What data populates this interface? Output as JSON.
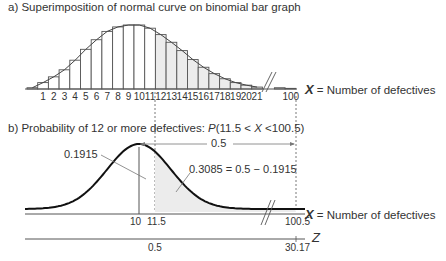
{
  "panel_a": {
    "title": "a) Superimposition of normal curve on binomial bar graph",
    "axis_label_var": "X",
    "axis_label_text": " = Number of defectives",
    "tick_labels": [
      "1",
      "2",
      "3",
      "4",
      "5",
      "6",
      "7",
      "8",
      "9",
      "10",
      "11",
      "12",
      "13",
      "14",
      "15",
      "16",
      "17",
      "18",
      "19",
      "20",
      "21",
      "100"
    ]
  },
  "panel_b": {
    "title_prefix": "b) Probability of 12 or more defectives: ",
    "title_p": "P",
    "title_expr_1": "(11.5 < ",
    "title_x": "X",
    "title_expr_2": " <100.5)",
    "label_0_5_top": "0.5",
    "label_left_area": "0.1915",
    "label_right_area": "0.3085 = 0.5 − 0.1915",
    "x_axis_label_var": "X",
    "x_axis_label_text": " = Number of defectives",
    "x_ticks": [
      "10",
      "11.5",
      "100.5"
    ],
    "z_axis_label": "Z",
    "z_ticks": [
      "0.5",
      "30.17"
    ]
  },
  "chart_data": [
    {
      "type": "bar",
      "title": "a) Superimposition of normal curve on binomial bar graph",
      "xlabel": "X = Number of defectives",
      "ylabel": "",
      "categories": [
        "0",
        "1",
        "2",
        "3",
        "4",
        "5",
        "6",
        "7",
        "8",
        "9",
        "10",
        "11",
        "12",
        "13",
        "14",
        "15",
        "16",
        "17",
        "18",
        "19",
        "20",
        "21",
        "...",
        "100"
      ],
      "values": [
        0.02,
        0.1,
        0.19,
        0.3,
        0.45,
        0.62,
        0.77,
        0.9,
        0.97,
        1.0,
        1.0,
        0.95,
        0.85,
        0.73,
        0.6,
        0.46,
        0.34,
        0.24,
        0.16,
        0.1,
        0.06,
        0.03,
        0.02,
        0.01
      ],
      "shaded_from": "12",
      "overlay": "normal curve",
      "grid": false
    },
    {
      "type": "area",
      "title": "b) Probability of 12 or more defectives: P(11.5 < X <100.5)",
      "xlabel": "X = Number of defectives",
      "secondary_xlabel": "Z",
      "x_ticks": [
        10,
        11.5,
        100.5
      ],
      "z_ticks": [
        0.5,
        30.17
      ],
      "mean": 10,
      "shaded_region": [
        11.5,
        100.5
      ],
      "annotations": [
        "0.1915",
        "0.3085 = 0.5 − 0.1915",
        "0.5"
      ],
      "areas": {
        "mean_to_11.5": 0.1915,
        "right_tail": 0.3085,
        "half": 0.5
      }
    }
  ]
}
